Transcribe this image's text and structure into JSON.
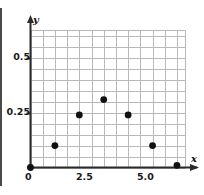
{
  "chart_data": {
    "type": "scatter",
    "title": "",
    "xlabel": "x",
    "ylabel": "y",
    "x": [
      0,
      1,
      2,
      3,
      4,
      5,
      6
    ],
    "values": [
      0,
      0.1,
      0.24,
      0.31,
      0.24,
      0.1,
      0.01
    ],
    "points": [
      {
        "x": 0,
        "y": 0
      },
      {
        "x": 1,
        "y": 0.1
      },
      {
        "x": 2,
        "y": 0.24
      },
      {
        "x": 3,
        "y": 0.31
      },
      {
        "x": 4,
        "y": 0.24
      },
      {
        "x": 5,
        "y": 0.1
      },
      {
        "x": 6,
        "y": 0.01
      }
    ],
    "xlim": [
      0,
      6.35
    ],
    "ylim": [
      0,
      0.625
    ],
    "xticks": [
      0,
      2.5,
      5.0
    ],
    "xticklabels": [
      "0",
      "2.5",
      "5.0"
    ],
    "yticks": [
      0,
      0.25,
      0.5
    ],
    "yticklabels": [
      "0",
      "0.25",
      "0.5"
    ],
    "grid": true,
    "grid_step_x": 0.5,
    "grid_step_y": 0.05,
    "legend": false,
    "legend_position": "none",
    "marker": "circle",
    "marker_color": "#111111",
    "grid_color": "#b9b9b9",
    "axis_color": "#2b2b2b"
  },
  "axis_labels": {
    "x": "x",
    "y": "y"
  },
  "tick_labels": {
    "x": [
      "0",
      "2.5",
      "5.0"
    ],
    "y": [
      "0.25",
      "0.5"
    ],
    "origin": "0"
  }
}
